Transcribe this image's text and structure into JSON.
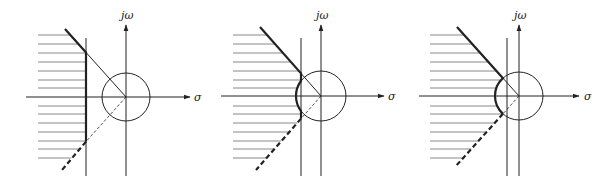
{
  "figure": {
    "axis_labels": {
      "imaginary": "jω",
      "real": "σ"
    },
    "colors": {
      "line": "#222222",
      "hatch": "#888888",
      "background": "#ffffff"
    }
  },
  "panels": [
    {
      "id": "panel-1",
      "origin": [
        126,
        97
      ],
      "radius": 24,
      "vline_x": 86,
      "axis_x_start": 26,
      "axis_x_end": 190,
      "axis_y_top": 25,
      "axis_y_bottom": 176,
      "hatch_x_start": 38,
      "hatch_ys": [
        35,
        44,
        53,
        62,
        71,
        80,
        88,
        106,
        114,
        123,
        132,
        141,
        149,
        158
      ],
      "thick_top_start": [
        65,
        29
      ],
      "dash_bottom_end": [
        62,
        170
      ],
      "boundary": "vertical",
      "sigma_label_pos": [
        194,
        101
      ],
      "jw_label_pos": [
        121,
        19
      ]
    },
    {
      "id": "panel-2",
      "origin": [
        321,
        96
      ],
      "radius": 25,
      "vline_x": 301,
      "axis_x_start": 221,
      "axis_x_end": 384,
      "axis_y_top": 25,
      "axis_y_bottom": 176,
      "hatch_x_start": 233,
      "hatch_ys": [
        35,
        44,
        53,
        62,
        71,
        80,
        88,
        106,
        114,
        123,
        132,
        141,
        149,
        158
      ],
      "thick_top_start": [
        260,
        27
      ],
      "dash_bottom_end": [
        256,
        170
      ],
      "boundary": "arc-small",
      "sigma_label_pos": [
        388,
        100
      ],
      "jw_label_pos": [
        316,
        19
      ]
    },
    {
      "id": "panel-3",
      "origin": [
        519,
        96
      ],
      "radius": 24,
      "vline_x": 507,
      "axis_x_start": 419,
      "axis_x_end": 579,
      "axis_y_top": 25,
      "axis_y_bottom": 176,
      "hatch_x_start": 430,
      "hatch_ys": [
        35,
        44,
        53,
        62,
        71,
        80,
        88,
        106,
        114,
        123,
        132,
        141,
        149,
        158
      ],
      "thick_top_start": [
        457,
        27
      ],
      "dash_bottom_end": [
        455,
        167
      ],
      "boundary": "arc-large",
      "sigma_label_pos": [
        584,
        100
      ],
      "jw_label_pos": [
        514,
        19
      ]
    }
  ]
}
